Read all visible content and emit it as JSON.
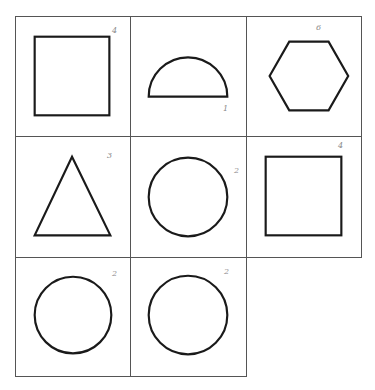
{
  "diagram": {
    "layout": "3x3 grid, bottom-right cell empty",
    "line_color": "#555555",
    "shape_stroke_color": "#1a1a1a",
    "cells": [
      {
        "row": 1,
        "col": 1,
        "shape": "square",
        "label": "4"
      },
      {
        "row": 1,
        "col": 2,
        "shape": "semicircle",
        "label": "1"
      },
      {
        "row": 1,
        "col": 3,
        "shape": "hexagon",
        "label": "6"
      },
      {
        "row": 2,
        "col": 1,
        "shape": "triangle",
        "label": "3"
      },
      {
        "row": 2,
        "col": 2,
        "shape": "circle",
        "label": "2"
      },
      {
        "row": 2,
        "col": 3,
        "shape": "square",
        "label": "4"
      },
      {
        "row": 3,
        "col": 1,
        "shape": "circle",
        "label": "2"
      },
      {
        "row": 3,
        "col": 2,
        "shape": "circle",
        "label": "2"
      }
    ]
  }
}
